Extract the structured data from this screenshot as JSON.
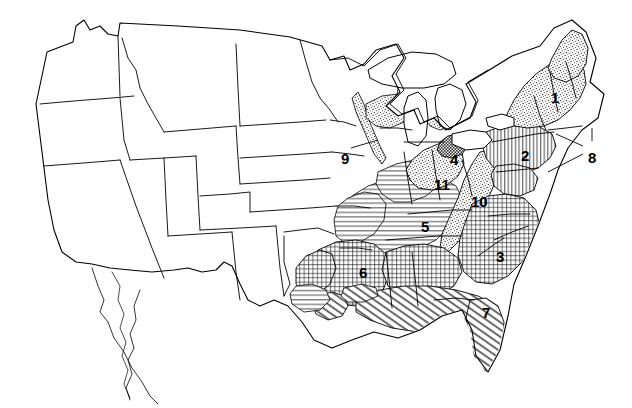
{
  "figure": {
    "kind": "map",
    "background_color": "#ffffff",
    "line_color": "#000000",
    "label_color": "#000000",
    "width": 632,
    "height": 408
  },
  "regions": [
    {
      "id": 1,
      "label": "1",
      "pattern": "stipple",
      "label_x": 551,
      "label_y": 90,
      "leader": false,
      "area": "northern-new-england"
    },
    {
      "id": 2,
      "label": "2",
      "pattern": "vertical-lines",
      "label_x": 521,
      "label_y": 148,
      "leader": false,
      "area": "mid-atlantic-interior"
    },
    {
      "id": 3,
      "label": "3",
      "pattern": "crosshatch-grid",
      "label_x": 496,
      "label_y": 249,
      "leader": false,
      "area": "southeast-piedmont"
    },
    {
      "id": 4,
      "label": "4",
      "pattern": "dense-dark",
      "label_x": 450,
      "label_y": 152,
      "leader": false,
      "area": "lake-erie-shore"
    },
    {
      "id": 5,
      "label": "5",
      "pattern": "horizontal-lines",
      "label_x": 421,
      "label_y": 219,
      "leader": false,
      "area": "interior-lowland"
    },
    {
      "id": 6,
      "label": "6",
      "pattern": "crosshatch-grid",
      "label_x": 359,
      "label_y": 265,
      "leader": false,
      "area": "lower-mississippi"
    },
    {
      "id": 7,
      "label": "7",
      "pattern": "diagonal-hatch",
      "label_x": 482,
      "label_y": 305,
      "leader": false,
      "area": "gulf-coastal-plain"
    },
    {
      "id": 8,
      "label": "8",
      "pattern": "coastal-outline",
      "label_x": 588,
      "label_y": 150,
      "leader": true,
      "area": "atlantic-coastal-islands"
    },
    {
      "id": 9,
      "label": "9",
      "pattern": "narrow-strip",
      "label_x": 341,
      "label_y": 151,
      "leader": true,
      "area": "upper-mississippi-valley"
    },
    {
      "id": 10,
      "label": "10",
      "pattern": "stipple",
      "label_x": 471,
      "label_y": 194,
      "leader": false,
      "area": "appalachian-ridge"
    },
    {
      "id": 11,
      "label": "11",
      "pattern": "stipple",
      "label_x": 434,
      "label_y": 177,
      "leader": false,
      "area": "ohio-valley"
    }
  ],
  "pattern_legend": {
    "stipple": "random fine dots",
    "vertical-lines": "evenly spaced vertical rules",
    "horizontal-lines": "evenly spaced horizontal rules",
    "crosshatch-grid": "fine square grid",
    "diagonal-hatch": "parallel diagonal rules",
    "dense-dark": "solid dark infill",
    "coastal-outline": "unfilled coastal shapes indicated by leader lines",
    "narrow-strip": "thin ragged band indicated by a leader line"
  }
}
